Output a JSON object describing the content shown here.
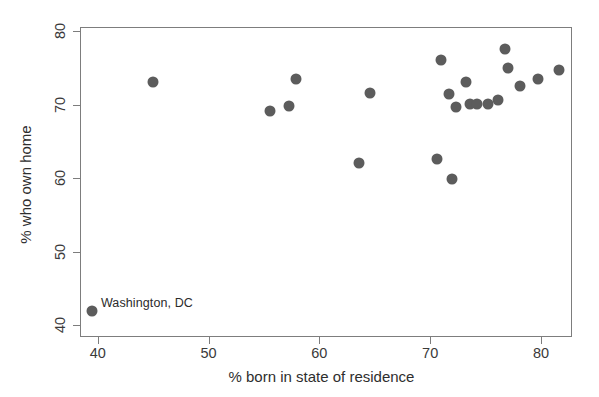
{
  "chart_data": {
    "type": "scatter",
    "title": "",
    "xlabel": "% born in state of residence",
    "ylabel": "% who own home",
    "xlim": [
      38.4,
      82.8
    ],
    "ylim": [
      38.4,
      80.6
    ],
    "xticks": [
      40,
      50,
      60,
      70,
      80
    ],
    "xticklabels": [
      "40",
      "50",
      "60",
      "70",
      "80"
    ],
    "yticks": [
      40,
      50,
      60,
      70,
      80
    ],
    "yticklabels": [
      "40",
      "50",
      "60",
      "70",
      "80"
    ],
    "grid": false,
    "legend": null,
    "marker_color": "#5c5c5c",
    "frame_color": "#7d7d7d",
    "points": [
      {
        "x": 39.4,
        "y": 42.1,
        "label": "Washington, DC"
      },
      {
        "x": 44.9,
        "y": 73.2,
        "label": ""
      },
      {
        "x": 55.5,
        "y": 69.3,
        "label": ""
      },
      {
        "x": 57.2,
        "y": 70.0,
        "label": ""
      },
      {
        "x": 57.8,
        "y": 73.6,
        "label": ""
      },
      {
        "x": 63.5,
        "y": 62.2,
        "label": ""
      },
      {
        "x": 64.5,
        "y": 71.8,
        "label": ""
      },
      {
        "x": 70.5,
        "y": 62.8,
        "label": ""
      },
      {
        "x": 70.9,
        "y": 76.3,
        "label": ""
      },
      {
        "x": 71.6,
        "y": 71.6,
        "label": ""
      },
      {
        "x": 71.9,
        "y": 60.0,
        "label": ""
      },
      {
        "x": 72.2,
        "y": 69.9,
        "label": ""
      },
      {
        "x": 73.1,
        "y": 73.3,
        "label": ""
      },
      {
        "x": 73.5,
        "y": 70.2,
        "label": ""
      },
      {
        "x": 74.1,
        "y": 70.2,
        "label": ""
      },
      {
        "x": 75.1,
        "y": 70.2,
        "label": ""
      },
      {
        "x": 76.0,
        "y": 70.8,
        "label": ""
      },
      {
        "x": 76.7,
        "y": 77.8,
        "label": ""
      },
      {
        "x": 76.9,
        "y": 75.1,
        "label": ""
      },
      {
        "x": 78.0,
        "y": 72.7,
        "label": ""
      },
      {
        "x": 79.6,
        "y": 73.6,
        "label": ""
      },
      {
        "x": 81.5,
        "y": 74.9,
        "label": ""
      }
    ],
    "annotations": [
      {
        "text": "Washington, DC",
        "x": 40.2,
        "y": 43.2
      }
    ]
  }
}
